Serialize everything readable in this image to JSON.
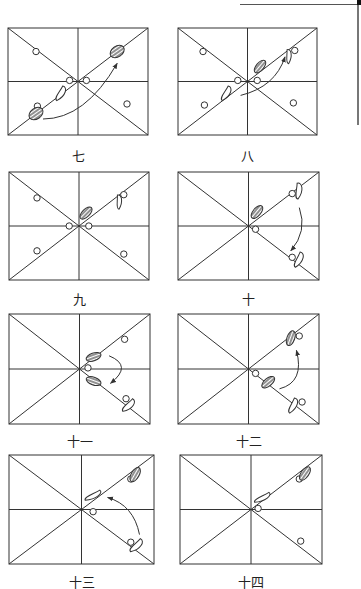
{
  "figure": {
    "type": "step-sequence diagram (footwork on grid, 8 panels)",
    "colors": {
      "line": "#333333",
      "hatched_fill": "#555555",
      "background": "#ffffff"
    },
    "panels": [
      {
        "id": "p7",
        "label": "七",
        "x": 8,
        "y": 28,
        "w": 140,
        "h": 107,
        "label_y": 146
      },
      {
        "id": "p8",
        "label": "八",
        "x": 178,
        "y": 28,
        "w": 139,
        "h": 107,
        "label_y": 146
      },
      {
        "id": "p9",
        "label": "九",
        "x": 9,
        "y": 172,
        "w": 140,
        "h": 108,
        "label_y": 289
      },
      {
        "id": "p10",
        "label": "十",
        "x": 178,
        "y": 172,
        "w": 141,
        "h": 108,
        "label_y": 289
      },
      {
        "id": "p11",
        "label": "十一",
        "x": 9,
        "y": 314,
        "w": 141,
        "h": 110,
        "label_y": 431
      },
      {
        "id": "p12",
        "label": "十二",
        "x": 178,
        "y": 314,
        "w": 141,
        "h": 110,
        "label_y": 431
      },
      {
        "id": "p13",
        "label": "十三",
        "x": 9,
        "y": 455,
        "w": 145,
        "h": 109,
        "label_y": 572
      },
      {
        "id": "p14",
        "label": "十四",
        "x": 180,
        "y": 455,
        "w": 142,
        "h": 109,
        "label_y": 572
      }
    ]
  }
}
